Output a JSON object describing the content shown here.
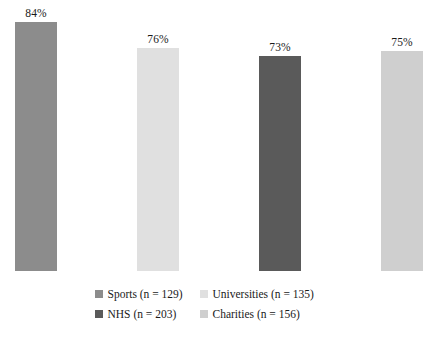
{
  "chart_data": {
    "type": "bar",
    "title": "",
    "subtitle": "",
    "xlabel": "",
    "ylabel": "",
    "ylim": [
      0,
      100
    ],
    "grid": false,
    "legend_position": "bottom",
    "categories": [
      "Sports",
      "Universities",
      "NHS",
      "Charities"
    ],
    "values": [
      84,
      76,
      73,
      75
    ],
    "data_labels": [
      "84%",
      "76%",
      "73%",
      "75%"
    ],
    "sample_sizes": [
      129,
      135,
      203,
      156
    ],
    "colors": [
      "#8c8c8c",
      "#e0e0e0",
      "#5a5a5a",
      "#cfcfcf"
    ],
    "bars": [
      {
        "label": "84%",
        "value": 84,
        "color": "#8c8c8c",
        "left_px": 15,
        "height_px": 249
      },
      {
        "label": "76%",
        "value": 76,
        "color": "#e0e0e0",
        "left_px": 137,
        "height_px": 223
      },
      {
        "label": "73%",
        "value": 73,
        "color": "#5a5a5a",
        "left_px": 259,
        "height_px": 215
      },
      {
        "label": "75%",
        "value": 75,
        "color": "#cfcfcf",
        "left_px": 381,
        "height_px": 220
      }
    ]
  },
  "legend": {
    "rows": [
      [
        {
          "label": "Sports (n = 129)",
          "color": "#8c8c8c"
        },
        {
          "label": "Universities (n = 135)",
          "color": "#e0e0e0"
        }
      ],
      [
        {
          "label": "NHS (n = 203)",
          "color": "#5a5a5a"
        },
        {
          "label": "Charities (n = 156)",
          "color": "#cfcfcf"
        }
      ]
    ]
  }
}
